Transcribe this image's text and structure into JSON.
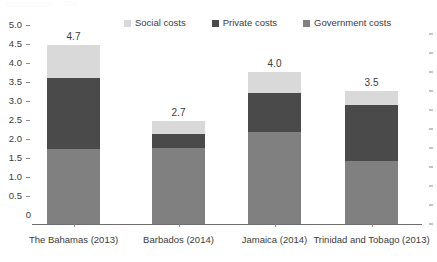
{
  "chart_data": {
    "type": "bar",
    "subtype": "stacked-bar",
    "title": "",
    "xlabel": "",
    "ylabel": "",
    "ylim": [
      0,
      5.0
    ],
    "yticks": [
      "0",
      "0.5",
      "1.0",
      "1.5",
      "2.0",
      "2.5",
      "3.0",
      "3.5",
      "4.0",
      "4.5",
      "5.0"
    ],
    "ytick_values": [
      0,
      0.5,
      1.0,
      1.5,
      2.0,
      2.5,
      3.0,
      3.5,
      4.0,
      4.5,
      5.0
    ],
    "grid": false,
    "legend_position": "top-center",
    "categories": [
      "The Bahamas (2013)",
      "Barbados (2014)",
      "Jamaica (2014)",
      "Trinidad and Tobago (2013)"
    ],
    "series": [
      {
        "name": "Government costs",
        "color": "#808080",
        "values": [
          1.98,
          1.99,
          2.43,
          1.65
        ]
      },
      {
        "name": "Private costs",
        "color": "#4a4a4a",
        "values": [
          1.87,
          0.39,
          1.02,
          1.47
        ]
      },
      {
        "name": "Social costs",
        "color": "#d9d9d9",
        "values": [
          0.85,
          0.32,
          0.55,
          0.38
        ]
      }
    ],
    "totals": [
      4.7,
      2.7,
      4.0,
      3.5
    ],
    "total_labels": [
      "4.7",
      "2.7",
      "4.0",
      "3.5"
    ]
  },
  "legend": {
    "items": [
      {
        "label": "Social costs",
        "color": "#d9d9d9"
      },
      {
        "label": "Private costs",
        "color": "#4a4a4a"
      },
      {
        "label": "Government costs",
        "color": "#808080"
      }
    ]
  },
  "axis": {
    "baseline_color": "#6e6e6e",
    "tick_color": "#8a8a8a"
  }
}
